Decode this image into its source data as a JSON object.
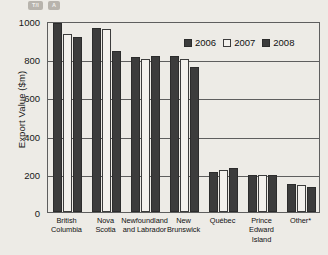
{
  "badges": [
    {
      "label": "T/I"
    },
    {
      "label": "A"
    }
  ],
  "chart_data": {
    "type": "bar",
    "title": "",
    "xlabel": "",
    "ylabel": "Export Value ($m)",
    "ylim": [
      0,
      1000
    ],
    "yticks": [
      1000,
      800,
      600,
      400,
      200,
      0
    ],
    "grid": true,
    "legend_position": "top-right",
    "categories": [
      "British Columbia",
      "Nova Scotia",
      "Newfoundland and Labrador",
      "New Brunswick",
      "Québec",
      "Prince Edward Island",
      "Other*"
    ],
    "category_lines": [
      [
        "British",
        "Columbia"
      ],
      [
        "Nova",
        "Scotia"
      ],
      [
        "Newfoundland",
        "and Labrador"
      ],
      [
        "New",
        "Brunswick"
      ],
      [
        "Québec",
        ""
      ],
      [
        "Prince Edward",
        "Island"
      ],
      [
        "Other*",
        ""
      ]
    ],
    "series": [
      {
        "name": "2006",
        "color": "#3c3c3c",
        "values": [
          990,
          965,
          810,
          815,
          210,
          195,
          145
        ]
      },
      {
        "name": "2007",
        "color": "#f3f1ed",
        "values": [
          930,
          960,
          800,
          800,
          220,
          195,
          140
        ]
      },
      {
        "name": "2008",
        "color": "#3c3c3c",
        "values": [
          915,
          845,
          815,
          760,
          230,
          195,
          130
        ]
      }
    ]
  }
}
